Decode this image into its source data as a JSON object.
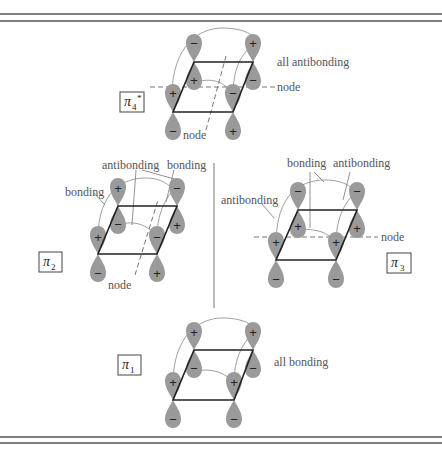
{
  "figure": {
    "colors": {
      "lobe": "#9a9a9a",
      "edge": "#222222",
      "frame": "#555555",
      "text": "#555555"
    }
  },
  "orbitals": [
    {
      "id": "pi4_star",
      "label": {
        "symbol": "π",
        "subscript": "4",
        "superscript": "*"
      },
      "annotations": [
        "all antibonding",
        "node",
        "node"
      ],
      "signs": {
        "back_left": [
          "−",
          "+"
        ],
        "back_right": [
          "+",
          "−"
        ],
        "front_left": [
          "+",
          "−"
        ],
        "front_right": [
          "−",
          "+"
        ]
      }
    },
    {
      "id": "pi2",
      "label": {
        "symbol": "π",
        "subscript": "2"
      },
      "annotations": [
        "bonding",
        "antibonding",
        "bonding",
        "node"
      ],
      "signs": {
        "back_left": [
          "+",
          "−"
        ],
        "back_right": [
          "−",
          "+"
        ],
        "front_left": [
          "+",
          "−"
        ],
        "front_right": [
          "−",
          "+"
        ]
      }
    },
    {
      "id": "pi3",
      "label": {
        "symbol": "π",
        "subscript": "3"
      },
      "annotations": [
        "bonding",
        "antibonding",
        "antibonding",
        "node"
      ],
      "signs": {
        "back_left": [
          "−",
          "+"
        ],
        "back_right": [
          "−",
          "+"
        ],
        "front_left": [
          "+",
          "−"
        ],
        "front_right": [
          "+",
          "−"
        ]
      }
    },
    {
      "id": "pi1",
      "label": {
        "symbol": "π",
        "subscript": "1"
      },
      "annotations": [
        "all bonding"
      ],
      "signs": {
        "back_left": [
          "+",
          "−"
        ],
        "back_right": [
          "+",
          "−"
        ],
        "front_left": [
          "+",
          "−"
        ],
        "front_right": [
          "+",
          "−"
        ]
      }
    }
  ],
  "text": {
    "pi4_all": "all antibonding",
    "pi4_node_h": "node",
    "pi4_node_d": "node",
    "pi2_bonding_left": "bonding",
    "pi2_antibonding": "antibonding",
    "pi2_bonding_right": "bonding",
    "pi2_node": "node",
    "pi3_bonding": "bonding",
    "pi3_antibonding_top": "antibonding",
    "pi3_antibonding_left": "antibonding",
    "pi3_node": "node",
    "pi1_all": "all bonding",
    "pi_symbol": "π",
    "sub1": "1",
    "sub2": "2",
    "sub3": "3",
    "sub4": "4",
    "star": "*",
    "plus": "+",
    "minus": "−"
  }
}
